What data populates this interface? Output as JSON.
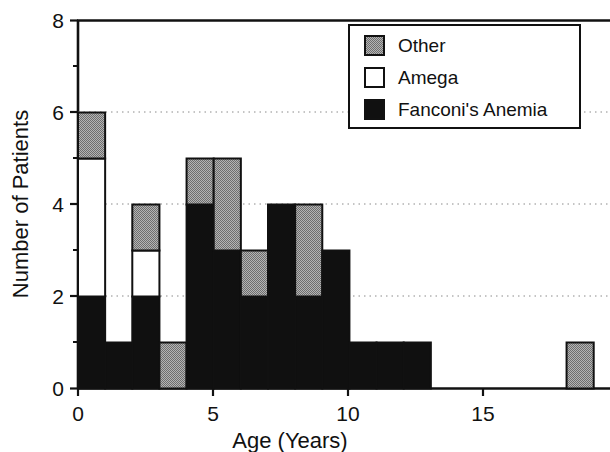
{
  "chart_data": {
    "type": "bar",
    "title": "",
    "subtitle": "",
    "xlabel": "Age (Years)",
    "ylabel": "Number of Patients",
    "xlim": [
      0,
      19.6
    ],
    "ylim": [
      0,
      8
    ],
    "xticks": [
      0,
      5,
      10,
      15
    ],
    "xtick_labels": [
      "0",
      "5",
      "10",
      "15"
    ],
    "yticks": [
      0,
      2,
      4,
      6,
      8
    ],
    "ytick_labels": [
      "0",
      "2",
      "4",
      "6",
      "8"
    ],
    "y_minor_ticks": [
      1,
      3,
      5,
      7
    ],
    "grid": "horizontal-dotted",
    "stacked": true,
    "bar_width": 1,
    "legend_position": "top-right",
    "legend": [
      {
        "name": "Other",
        "color": "#969696",
        "pattern": "dither-gray"
      },
      {
        "name": "Amega",
        "color": "#ffffff",
        "pattern": "solid-white"
      },
      {
        "name": "Fanconi's Anemia",
        "color": "#101010",
        "pattern": "solid-black"
      }
    ],
    "categories": [
      0,
      1,
      2,
      3,
      4,
      5,
      6,
      7,
      8,
      9,
      10,
      11,
      12,
      18
    ],
    "series": [
      {
        "name": "Fanconi's Anemia",
        "color": "#101010",
        "values": [
          2,
          1,
          2,
          0,
          4,
          3,
          2,
          4,
          2,
          3,
          1,
          1,
          1,
          0
        ]
      },
      {
        "name": "Amega",
        "color": "#ffffff",
        "values": [
          3,
          0,
          1,
          0,
          0,
          0,
          0,
          0,
          0,
          0,
          0,
          0,
          0,
          0
        ]
      },
      {
        "name": "Other",
        "color": "#969696",
        "values": [
          1,
          0,
          1,
          1,
          1,
          2,
          1,
          0,
          2,
          0,
          0,
          0,
          0,
          1
        ]
      }
    ],
    "totals": [
      6,
      1,
      4,
      1,
      5,
      5,
      3,
      4,
      4,
      3,
      1,
      1,
      1,
      1
    ]
  },
  "axes": {
    "y_axis_title": "Number of Patients",
    "x_axis_title": "Age (Years)"
  }
}
